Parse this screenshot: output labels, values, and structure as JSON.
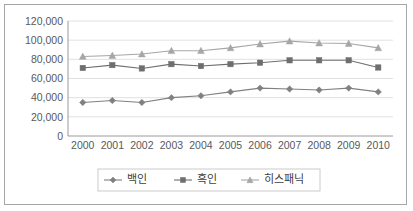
{
  "chart_data": {
    "type": "line",
    "title": "",
    "subtitle": "",
    "xlabel": "",
    "ylabel": "",
    "categories": [
      "2000",
      "2001",
      "2002",
      "2003",
      "2004",
      "2005",
      "2006",
      "2007",
      "2008",
      "2009",
      "2010"
    ],
    "series": [
      {
        "name": "백인",
        "marker": "diamond",
        "color": "#808080",
        "values": [
          35000,
          37000,
          35000,
          40000,
          42000,
          46000,
          50000,
          49000,
          48000,
          50000,
          46000
        ]
      },
      {
        "name": "흑인",
        "marker": "square",
        "color": "#6e6e6e",
        "values": [
          71000,
          74000,
          70500,
          75000,
          73000,
          75000,
          76500,
          79000,
          79000,
          79000,
          71500
        ]
      },
      {
        "name": "히스패닉",
        "marker": "triangle",
        "color": "#a6a6a6",
        "values": [
          83000,
          84000,
          85500,
          89000,
          89000,
          92000,
          96000,
          99000,
          97000,
          96500,
          92000
        ]
      }
    ],
    "ylim": [
      0,
      120000
    ],
    "ytick_step": 20000,
    "ytick_labels": [
      "0",
      "20,000",
      "40,000",
      "60,000",
      "80,000",
      "100,000",
      "120,000"
    ],
    "grid": true,
    "legend_position": "bottom"
  },
  "legend": {
    "items": [
      {
        "label": "백인",
        "marker": "diamond"
      },
      {
        "label": "흑인",
        "marker": "square"
      },
      {
        "label": "히스패닉",
        "marker": "triangle"
      }
    ]
  },
  "colors": {
    "white_series": "#808080",
    "black_series": "#6e6e6e",
    "hispanic_series": "#a6a6a6",
    "gridline": "#d9d9d9",
    "axis": "#9a9a9a",
    "text": "#595959",
    "border": "#a6a6a6",
    "background": "#ffffff"
  }
}
